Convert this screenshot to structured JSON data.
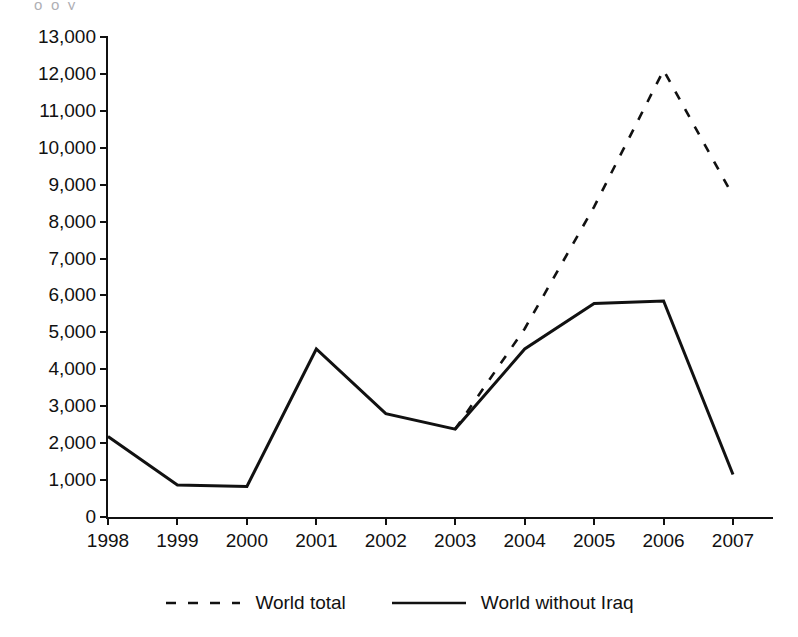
{
  "chart_data": {
    "type": "line",
    "title": "",
    "subtitle": "",
    "xlabel": "",
    "ylabel": "",
    "categories": [
      "1998",
      "1999",
      "2000",
      "2001",
      "2002",
      "2003",
      "2004",
      "2005",
      "2006",
      "2007"
    ],
    "xlim": [
      "1998",
      "2007"
    ],
    "ylim": [
      0,
      13000
    ],
    "y_ticks": [
      "0",
      "1,000",
      "2,000",
      "3,000",
      "4,000",
      "5,000",
      "6,000",
      "7,000",
      "8,000",
      "9,000",
      "10,000",
      "11,000",
      "12,000",
      "13,000"
    ],
    "y_tick_values": [
      0,
      1000,
      2000,
      3000,
      4000,
      5000,
      6000,
      7000,
      8000,
      9000,
      10000,
      11000,
      12000,
      13000
    ],
    "grid": false,
    "legend_position": "bottom",
    "series": [
      {
        "name": "World total",
        "style": "dashed",
        "color": "#111111",
        "x": [
          "2003",
          "2004",
          "2005",
          "2006",
          "2007"
        ],
        "values": [
          2380,
          5100,
          8400,
          12100,
          8700
        ]
      },
      {
        "name": "World without Iraq",
        "style": "solid",
        "color": "#111111",
        "x": [
          "1998",
          "1999",
          "2000",
          "2001",
          "2002",
          "2003",
          "2004",
          "2005",
          "2006",
          "2007"
        ],
        "values": [
          2180,
          870,
          830,
          4550,
          2800,
          2380,
          4550,
          5780,
          5850,
          1150
        ]
      }
    ]
  },
  "legend": {
    "items": [
      {
        "label": "World total",
        "swatch": "dashed-line-swatch"
      },
      {
        "label": "World without Iraq",
        "swatch": "solid-line-swatch"
      }
    ]
  },
  "artifacts": {
    "top_clipped_text": "o        o                    y"
  }
}
